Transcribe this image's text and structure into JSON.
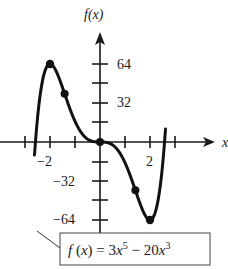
{
  "chart_data": {
    "type": "line",
    "title": "",
    "function": "f(x) = 3x^5 - 20x^3",
    "xlabel": "x",
    "ylabel": "f(x)",
    "x_ticks": [
      -3,
      -2,
      -1,
      0,
      1,
      2,
      3
    ],
    "x_tick_labels": [
      {
        "value": -2,
        "label": "−2"
      },
      {
        "value": 2,
        "label": "2"
      }
    ],
    "y_ticks": [
      -64,
      -48,
      -32,
      -16,
      0,
      16,
      32,
      48,
      64
    ],
    "y_tick_labels": [
      {
        "value": 64,
        "label": "64"
      },
      {
        "value": 32,
        "label": "32"
      },
      {
        "value": -32,
        "label": "−32"
      },
      {
        "value": -64,
        "label": "−64"
      }
    ],
    "xlim": [
      -3.3,
      3.9
    ],
    "ylim": [
      -72,
      80
    ],
    "grid": false,
    "highlighted_points": [
      {
        "x": -2,
        "y": 64
      },
      {
        "x": -1.41,
        "y": 39.6
      },
      {
        "x": 0,
        "y": 0
      },
      {
        "x": 1.41,
        "y": -39.6
      },
      {
        "x": 2,
        "y": -64
      }
    ],
    "annotations": [
      {
        "text": "f(x) = 3x⁵ − 20x³",
        "position": "bottom-right box with leader line"
      }
    ]
  },
  "labels": {
    "y_axis": "f(x)",
    "x_axis": "x",
    "y64": "64",
    "y32": "32",
    "yn32": "−32",
    "yn64": "−64",
    "xn2": "−2",
    "x2": "2",
    "formula_lhs": "f(x) = 3x",
    "formula_exp1": "5",
    "formula_mid": " − 20x",
    "formula_exp2": "3"
  }
}
